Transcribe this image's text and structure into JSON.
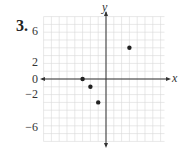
{
  "problem": {
    "number": "3."
  },
  "chart_data": {
    "type": "scatter",
    "title": "",
    "xlabel": "x",
    "ylabel": "y",
    "xlim": [
      -8,
      8
    ],
    "ylim": [
      -8,
      8
    ],
    "grid": true,
    "ytick_labels": [
      "6",
      "2",
      "0",
      "−2",
      "−6"
    ],
    "points": [
      {
        "x": -3,
        "y": 0
      },
      {
        "x": -2,
        "y": -1
      },
      {
        "x": -1,
        "y": -3
      },
      {
        "x": 3,
        "y": 4
      }
    ]
  },
  "colors": {
    "grid": "#d8d8d8",
    "axis": "#333333",
    "point": "#222222"
  }
}
